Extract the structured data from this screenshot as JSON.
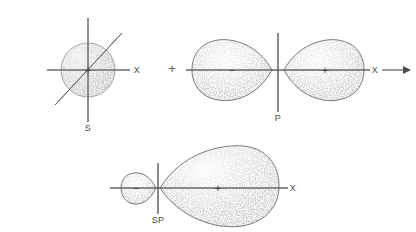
{
  "figure": {
    "background_color": "#ffffff",
    "ink_color": "#5a5a5a",
    "width": 416,
    "height": 232
  },
  "equation": {
    "operator_plus": "+",
    "operator_plus_name": "plus-operator",
    "yields_arrow_name": "yields-arrow"
  },
  "orbitals": [
    {
      "id": "s-orbital",
      "label": "S",
      "type": "s",
      "shape": "sphere",
      "center": {
        "x": 88,
        "y": 70
      },
      "radius": 27,
      "axis_label_x": "X",
      "lobes": [
        {
          "sign": "+",
          "position": "center",
          "size": "large"
        }
      ],
      "axes": [
        "x-horizontal",
        "z-vertical",
        "y-diagonal"
      ]
    },
    {
      "id": "p-orbital",
      "label": "P",
      "type": "p",
      "shape": "two-lobe",
      "center": {
        "x": 278,
        "y": 70
      },
      "axis_label_x": "X",
      "lobes": [
        {
          "sign": "−",
          "position": "left",
          "size": "medium"
        },
        {
          "sign": "+",
          "position": "right",
          "size": "medium"
        }
      ],
      "axes": [
        "x-horizontal",
        "z-vertical"
      ]
    },
    {
      "id": "sp-hybrid-orbital",
      "label": "SP",
      "type": "sp",
      "shape": "asymmetric-two-lobe",
      "center": {
        "x": 158,
        "y": 188
      },
      "axis_label_x": "X",
      "lobes": [
        {
          "sign": "−",
          "position": "left",
          "size": "small"
        },
        {
          "sign": "+",
          "position": "right",
          "size": "large"
        }
      ],
      "axes": [
        "x-horizontal",
        "z-vertical"
      ]
    }
  ],
  "labels": {
    "s_label": "S",
    "p_label": "P",
    "sp_label": "SP",
    "axis_x_top_left": "X",
    "axis_x_top_right": "X",
    "axis_x_bottom": "X",
    "s_plus_sign": "+",
    "p_minus_sign": "−",
    "p_plus_sign": "+",
    "sp_minus_sign": "−",
    "sp_plus_sign": "+"
  }
}
